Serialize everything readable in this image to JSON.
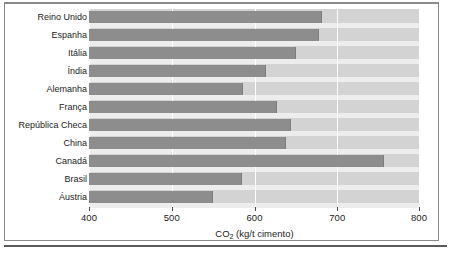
{
  "chart_data": {
    "type": "bar",
    "orientation": "horizontal",
    "title": "",
    "xlabel": "CO2 (kg/t cimento)",
    "xlabel_parts": {
      "prefix": "CO",
      "sub": "2",
      "suffix": " (kg/t cimento)"
    },
    "ylabel": "",
    "xlim": [
      400,
      800
    ],
    "xticks": [
      400,
      500,
      600,
      700,
      800
    ],
    "xtick_labels": [
      "400",
      "500",
      "600",
      "700",
      "800"
    ],
    "grid": "vertical-white-at-xticks",
    "legend": "none",
    "categories": [
      "Reino Unido",
      "Espanha",
      "Itália",
      "Índia",
      "Alemanha",
      "França",
      "República Checa",
      "China",
      "Canadá",
      "Brasil",
      "Áustria"
    ],
    "values": [
      681,
      678,
      650,
      614,
      586,
      627,
      644,
      638,
      757,
      585,
      550
    ],
    "colors": {
      "bar": "#8d8d8d",
      "plot_background": "#d3d3d3",
      "gridline": "#ffffff",
      "page_background": "#ffffff",
      "frame": "#8a8a8a",
      "text": "#1c1c1c"
    }
  }
}
